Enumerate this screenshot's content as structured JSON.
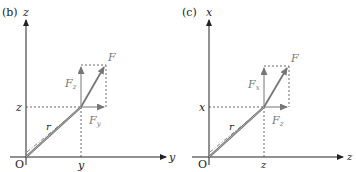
{
  "panels": [
    {
      "id": "b",
      "panel_label": "(b)",
      "vertical_axis": "z",
      "horizontal_axis": "y",
      "origin_label": "O",
      "point_vertical_label": "z",
      "point_horizontal_label": "y",
      "position_vector_label": "r",
      "force_label": "F",
      "vertical_component_label": "F",
      "vertical_component_sub": "z",
      "horizontal_component_label": "F",
      "horizontal_component_sub": "y"
    },
    {
      "id": "c",
      "panel_label": "(c)",
      "vertical_axis": "x",
      "horizontal_axis": "z",
      "origin_label": "O",
      "point_vertical_label": "x",
      "point_horizontal_label": "z",
      "position_vector_label": "r",
      "force_label": "F",
      "vertical_component_label": "F",
      "vertical_component_sub": "x",
      "horizontal_component_label": "F",
      "horizontal_component_sub": "z"
    }
  ],
  "colors": {
    "axis": "#222222",
    "vector": "#777777",
    "dashed": "#444444"
  }
}
